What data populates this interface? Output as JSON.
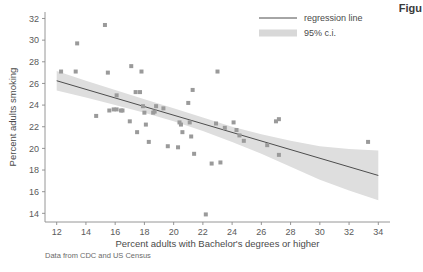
{
  "figure": {
    "corner_label": "Figu",
    "source_note": "Data from CDC and US Census"
  },
  "chart_data": {
    "type": "scatter",
    "title": "",
    "xlabel": "Percent adults with Bachelor's degrees or higher",
    "ylabel": "Percent adults smoking",
    "xlim": [
      11.2,
      34.8
    ],
    "ylim": [
      13.2,
      32.6
    ],
    "xticks": [
      12,
      14,
      16,
      18,
      20,
      22,
      24,
      26,
      28,
      30,
      32,
      34
    ],
    "yticks": [
      14,
      16,
      18,
      20,
      22,
      24,
      26,
      28,
      30,
      32
    ],
    "grid": false,
    "legend_position": "top-right",
    "legend": [
      {
        "label": "regression line",
        "marker": "line",
        "color": "#4d4d4d"
      },
      {
        "label": "95% c.i.",
        "marker": "band",
        "color": "#d8d8d8"
      }
    ],
    "marker": {
      "shape": "square",
      "color": "#9a9a9a",
      "size": 4
    },
    "points": [
      {
        "x": 12.3,
        "y": 27.1
      },
      {
        "x": 13.3,
        "y": 27.1
      },
      {
        "x": 13.4,
        "y": 29.7
      },
      {
        "x": 14.7,
        "y": 23.0
      },
      {
        "x": 15.3,
        "y": 31.4
      },
      {
        "x": 15.5,
        "y": 27.0
      },
      {
        "x": 15.6,
        "y": 23.5
      },
      {
        "x": 15.9,
        "y": 23.6
      },
      {
        "x": 16.1,
        "y": 23.6
      },
      {
        "x": 16.4,
        "y": 23.5
      },
      {
        "x": 16.5,
        "y": 23.5
      },
      {
        "x": 16.1,
        "y": 24.9
      },
      {
        "x": 17.0,
        "y": 22.5
      },
      {
        "x": 17.1,
        "y": 27.6
      },
      {
        "x": 17.4,
        "y": 25.2
      },
      {
        "x": 17.7,
        "y": 25.2
      },
      {
        "x": 17.5,
        "y": 21.5
      },
      {
        "x": 17.8,
        "y": 27.1
      },
      {
        "x": 17.9,
        "y": 23.9
      },
      {
        "x": 18.0,
        "y": 23.3
      },
      {
        "x": 18.1,
        "y": 22.2
      },
      {
        "x": 18.3,
        "y": 20.6
      },
      {
        "x": 18.6,
        "y": 23.3
      },
      {
        "x": 18.7,
        "y": 23.4
      },
      {
        "x": 18.8,
        "y": 23.9
      },
      {
        "x": 19.3,
        "y": 23.7
      },
      {
        "x": 19.6,
        "y": 20.2
      },
      {
        "x": 20.3,
        "y": 20.1
      },
      {
        "x": 20.4,
        "y": 22.4
      },
      {
        "x": 20.5,
        "y": 22.2
      },
      {
        "x": 20.6,
        "y": 21.5
      },
      {
        "x": 21.0,
        "y": 24.2
      },
      {
        "x": 21.1,
        "y": 22.4
      },
      {
        "x": 21.2,
        "y": 21.1
      },
      {
        "x": 21.3,
        "y": 25.4
      },
      {
        "x": 21.4,
        "y": 19.5
      },
      {
        "x": 22.2,
        "y": 13.9
      },
      {
        "x": 22.6,
        "y": 18.6
      },
      {
        "x": 22.9,
        "y": 22.3
      },
      {
        "x": 23.0,
        "y": 27.1
      },
      {
        "x": 23.2,
        "y": 18.7
      },
      {
        "x": 23.5,
        "y": 21.9
      },
      {
        "x": 24.1,
        "y": 22.4
      },
      {
        "x": 24.3,
        "y": 21.7
      },
      {
        "x": 24.5,
        "y": 21.2
      },
      {
        "x": 24.8,
        "y": 20.7
      },
      {
        "x": 26.4,
        "y": 20.3
      },
      {
        "x": 27.0,
        "y": 22.5
      },
      {
        "x": 27.2,
        "y": 22.7
      },
      {
        "x": 27.2,
        "y": 19.4
      },
      {
        "x": 33.3,
        "y": 20.6
      }
    ],
    "regression_line": {
      "x_start": 12.0,
      "y_start": 26.25,
      "x_end": 34.0,
      "y_end": 17.5,
      "color": "#4d4d4d"
    },
    "confidence_band": {
      "level": "95%",
      "color": "#dedede",
      "x": [
        12.0,
        14.0,
        16.0,
        18.0,
        20.0,
        22.0,
        24.0,
        26.0,
        28.0,
        30.0,
        32.0,
        34.0
      ],
      "upper": [
        27.15,
        26.25,
        25.4,
        24.55,
        23.7,
        22.85,
        22.0,
        21.3,
        20.7,
        20.2,
        19.95,
        19.8
      ],
      "lower": [
        25.35,
        24.7,
        24.0,
        23.3,
        22.5,
        21.6,
        20.6,
        19.5,
        18.3,
        17.1,
        16.1,
        15.2
      ]
    }
  }
}
